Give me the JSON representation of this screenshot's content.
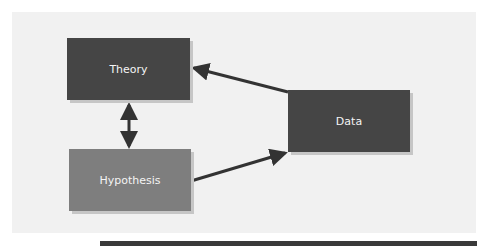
{
  "diagram": {
    "nodes": [
      {
        "id": "theory",
        "label": "Theory",
        "color": "#454545"
      },
      {
        "id": "hypothesis",
        "label": "Hypothesis",
        "color": "#7e7e7e"
      },
      {
        "id": "data",
        "label": "Data",
        "color": "#454545"
      }
    ],
    "edges": [
      {
        "from": "data",
        "to": "theory",
        "type": "arrow"
      },
      {
        "from": "hypothesis",
        "to": "data",
        "type": "arrow"
      },
      {
        "from": "theory",
        "to": "hypothesis",
        "type": "bidirectional"
      }
    ]
  }
}
